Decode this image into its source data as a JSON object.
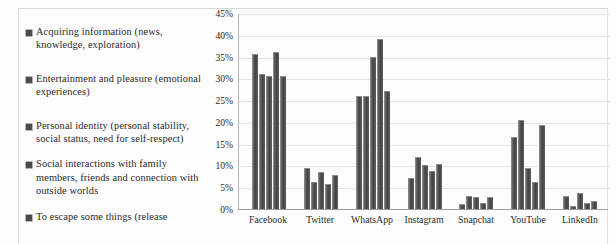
{
  "legend": {
    "items": [
      {
        "label": "Acquiring information (news, knowledge, exploration)"
      },
      {
        "label": "Entertainment and pleasure (emotional experiences)"
      },
      {
        "label": "Personal identity (personal stability, social status, need for self-respect)"
      },
      {
        "label": "Social interactions with family members, friends and connection with outside worlds"
      },
      {
        "label": "To escape some things (release"
      }
    ]
  },
  "axis": {
    "y_ticks": [
      "45%",
      "40%",
      "35%",
      "30%",
      "25%",
      "20%",
      "15%",
      "10%",
      "5%",
      "0%"
    ],
    "x_labels": [
      "Facebook",
      "Twitter",
      "WhatsApp",
      "Instagram",
      "Snapchat",
      "YouTube",
      "LinkedIn"
    ]
  },
  "chart_data": {
    "type": "bar",
    "title": "",
    "xlabel": "",
    "ylabel": "",
    "ylim": [
      0,
      45
    ],
    "ytick_step": 5,
    "grid": true,
    "legend_position": "left",
    "categories": [
      "Facebook",
      "Twitter",
      "WhatsApp",
      "Instagram",
      "Snapchat",
      "YouTube",
      "LinkedIn"
    ],
    "series": [
      {
        "name": "Acquiring information (news, knowledge, exploration)",
        "values": [
          35.5,
          9.5,
          26.0,
          7.2,
          1.2,
          16.5,
          3.0
        ]
      },
      {
        "name": "Entertainment and pleasure (emotional experiences)",
        "values": [
          31.0,
          6.2,
          26.0,
          12.0,
          3.0,
          20.5,
          0.8
        ]
      },
      {
        "name": "Personal identity (personal stability, social status, need for self-respect)",
        "values": [
          30.5,
          8.5,
          35.0,
          10.2,
          2.7,
          9.4,
          3.7
        ]
      },
      {
        "name": "Social interactions with family members, friends and connection with outside worlds",
        "values": [
          36.0,
          5.7,
          39.0,
          8.7,
          1.3,
          6.2,
          1.3
        ]
      },
      {
        "name": "To escape some things (release",
        "values": [
          30.5,
          7.8,
          27.0,
          10.4,
          2.8,
          19.2,
          1.9
        ]
      }
    ]
  }
}
